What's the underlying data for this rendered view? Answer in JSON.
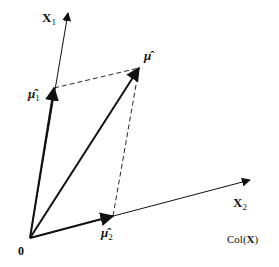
{
  "diagram": {
    "origin": {
      "label": "0",
      "x": 30,
      "y": 238
    },
    "axes": [
      {
        "id": "X1",
        "label": "X",
        "subscript": "1",
        "tip": {
          "x": 68,
          "y": 13
        },
        "label_pos": {
          "x": 42,
          "y": 22
        }
      },
      {
        "id": "X2",
        "label": "X",
        "subscript": "2",
        "tip": {
          "x": 250,
          "y": 180
        },
        "label_pos": {
          "x": 233,
          "y": 207
        }
      }
    ],
    "vectors": [
      {
        "id": "mu_hat",
        "label": "μ̂",
        "subscript": "",
        "tip": {
          "x": 139,
          "y": 68
        },
        "label_pos": {
          "x": 144,
          "y": 60
        }
      },
      {
        "id": "mu_hat_1",
        "label": "μ̂",
        "subscript": "1",
        "tip": {
          "x": 54,
          "y": 88
        },
        "label_pos": {
          "x": 28,
          "y": 98
        }
      },
      {
        "id": "mu_hat_2",
        "label": "μ̂",
        "subscript": "2",
        "tip": {
          "x": 113,
          "y": 216
        },
        "label_pos": {
          "x": 101,
          "y": 237
        }
      }
    ],
    "dashed_lines": [
      {
        "from": "mu_hat_1",
        "to": "mu_hat"
      },
      {
        "from": "mu_hat_2",
        "to": "mu_hat"
      }
    ],
    "plane_label": {
      "text": "Col(",
      "bold_part": "X",
      "close": ")",
      "x": 227,
      "y": 243
    },
    "colors": {
      "stroke": "#111111",
      "background": "#ffffff"
    }
  }
}
